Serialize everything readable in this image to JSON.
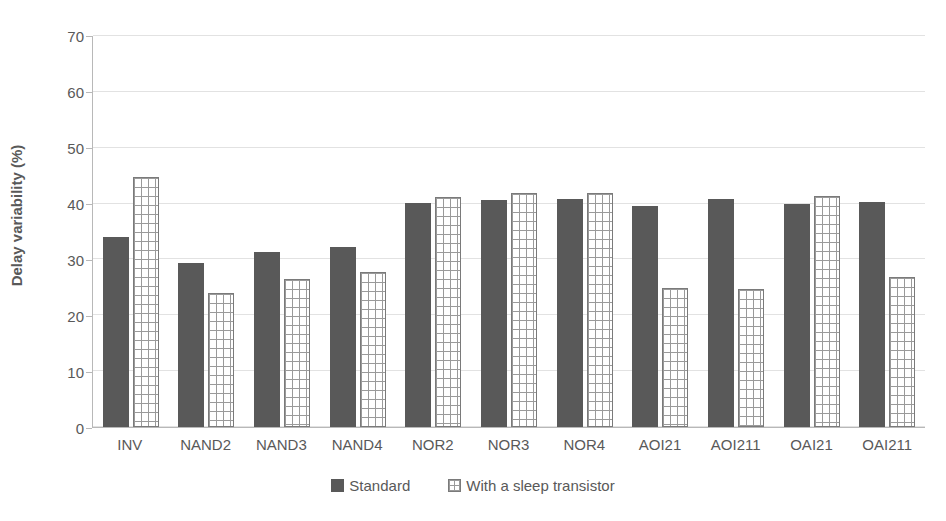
{
  "chart_data": {
    "type": "bar",
    "title": "",
    "xlabel": "",
    "ylabel": "Delay variability (%)",
    "ylim": [
      0,
      70
    ],
    "ytick_step": 10,
    "yticks": [
      0,
      10,
      20,
      30,
      40,
      50,
      60,
      70
    ],
    "grid": true,
    "legend_position": "bottom",
    "categories": [
      "INV",
      "NAND2",
      "NAND3",
      "NAND4",
      "NOR2",
      "NOR3",
      "NOR4",
      "AOI21",
      "AOI211",
      "OAI21",
      "OAI211"
    ],
    "series": [
      {
        "name": "Standard",
        "color": "#595959",
        "pattern": "solid",
        "values": [
          34.0,
          29.2,
          31.3,
          32.1,
          40.0,
          40.6,
          40.7,
          39.5,
          40.7,
          39.9,
          40.1
        ]
      },
      {
        "name": "With a sleep transistor",
        "color": "#ffffff",
        "pattern": "grid",
        "values": [
          44.7,
          24.0,
          26.5,
          27.6,
          41.1,
          41.7,
          41.7,
          24.9,
          24.7,
          41.3,
          26.8
        ]
      }
    ]
  },
  "legend": {
    "items": [
      {
        "label": "Standard",
        "swatch": "standard"
      },
      {
        "label": "With a sleep transistor",
        "swatch": "sleep"
      }
    ]
  },
  "colors": {
    "standard_bar": "#595959",
    "sleep_bar_fill": "#ffffff",
    "sleep_bar_border": "#7a7a7a",
    "sleep_bar_pattern": "#9a9a9a",
    "gridline": "#e2e2e2",
    "axis": "#b8b8b8",
    "text": "#595959",
    "background": "#ffffff"
  }
}
